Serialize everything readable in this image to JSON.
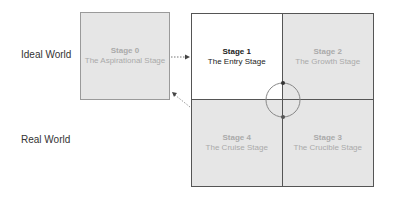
{
  "rows": {
    "ideal": "Ideal World",
    "real": "Real World"
  },
  "stages": [
    {
      "id": 0,
      "title": "Stage 0",
      "subtitle": "The Aspirational Stage"
    },
    {
      "id": 1,
      "title": "Stage 1",
      "subtitle": "The Entry Stage"
    },
    {
      "id": 2,
      "title": "Stage 2",
      "subtitle": "The Growth Stage"
    },
    {
      "id": 3,
      "title": "Stage 3",
      "subtitle": "The Crucible Stage"
    },
    {
      "id": 4,
      "title": "Stage 4",
      "subtitle": "The Cruise Stage"
    }
  ],
  "colors": {
    "highlight": "#ffffff",
    "inactive_fill": "#e6e6e6",
    "border": "#555555",
    "inactive_text": "#aaaaaa"
  }
}
